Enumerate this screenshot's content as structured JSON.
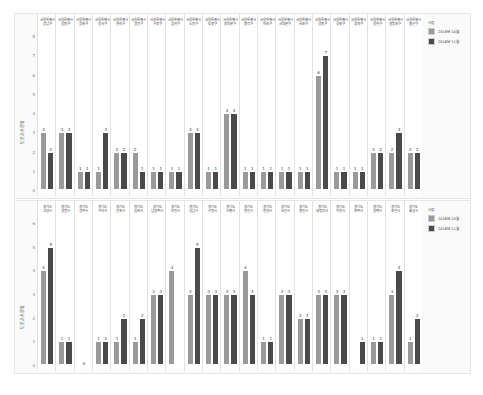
{
  "colors": {
    "oct": "#9a9a9a",
    "nov": "#4a4a4a"
  },
  "legend": {
    "title": "시점",
    "items": [
      "2016년 10월",
      "2016년 11월"
    ]
  },
  "chart_data": [
    {
      "type": "bar",
      "title": "",
      "ylabel": "도로공사현황",
      "ylim": [
        0,
        8
      ],
      "yticks": [
        0,
        1,
        2,
        3,
        4,
        5,
        6,
        7,
        8
      ],
      "categories": [
        "서울특별시 강남구",
        "서울특별시 강동구",
        "서울특별시 강북구",
        "서울특별시 강서구",
        "서울특별시 관악구",
        "서울특별시 광진구",
        "서울특별시 구로구",
        "서울특별시 금천구",
        "서울특별시 노원구",
        "서울특별시 도봉구",
        "서울특별시 동대문구",
        "서울특별시 동작구",
        "서울특별시 마포구",
        "서울특별시 서대문구",
        "서울특별시 서초구",
        "서울특별시 성동구",
        "서울특별시 성북구",
        "서울특별시 송파구",
        "서울특별시 양천구",
        "서울특별시 영등포구",
        "서울특별시 용산구"
      ],
      "series": [
        {
          "name": "2016년 10월",
          "values": [
            3,
            3,
            1,
            1,
            2,
            2,
            1,
            1,
            3,
            1,
            4,
            1,
            1,
            1,
            1,
            6,
            1,
            1,
            2,
            2,
            2
          ]
        },
        {
          "name": "2016년 11월",
          "values": [
            2,
            3,
            1,
            3,
            2,
            1,
            1,
            1,
            3,
            1,
            4,
            1,
            1,
            1,
            1,
            7,
            1,
            1,
            2,
            3,
            2
          ]
        }
      ],
      "legend_position": "right"
    },
    {
      "type": "bar",
      "title": "",
      "ylabel": "도로공사현황",
      "ylim": [
        0,
        6
      ],
      "yticks": [
        0,
        1,
        2,
        3,
        4,
        5,
        6
      ],
      "categories": [
        "경기도 고양시",
        "경기도 광명시",
        "경기도 광주시",
        "경기도 구리시",
        "경기도 군포시",
        "경기도 김포시",
        "경기도 남양주시",
        "경기도 부천시",
        "경기도 성남시",
        "경기도 수원시",
        "경기도 시흥시",
        "경기도 안산시",
        "경기도 안양시",
        "경기도 오산시",
        "경기도 용인시",
        "경기도 의정부시",
        "경기도 이천시",
        "경기도 파주시",
        "경기도 평택시",
        "경기도 포천시",
        "경기도 화성시"
      ],
      "series": [
        {
          "name": "2016년 10월",
          "values": [
            4,
            1,
            0,
            1,
            1,
            1,
            3,
            4,
            3,
            3,
            3,
            4,
            1,
            3,
            2,
            3,
            3,
            0,
            1,
            3,
            1
          ]
        },
        {
          "name": "2016년 11월",
          "values": [
            5,
            1,
            0,
            1,
            2,
            2,
            3,
            0,
            5,
            3,
            3,
            3,
            1,
            3,
            2,
            3,
            3,
            1,
            1,
            4,
            2
          ]
        }
      ],
      "legend_position": "right"
    }
  ]
}
